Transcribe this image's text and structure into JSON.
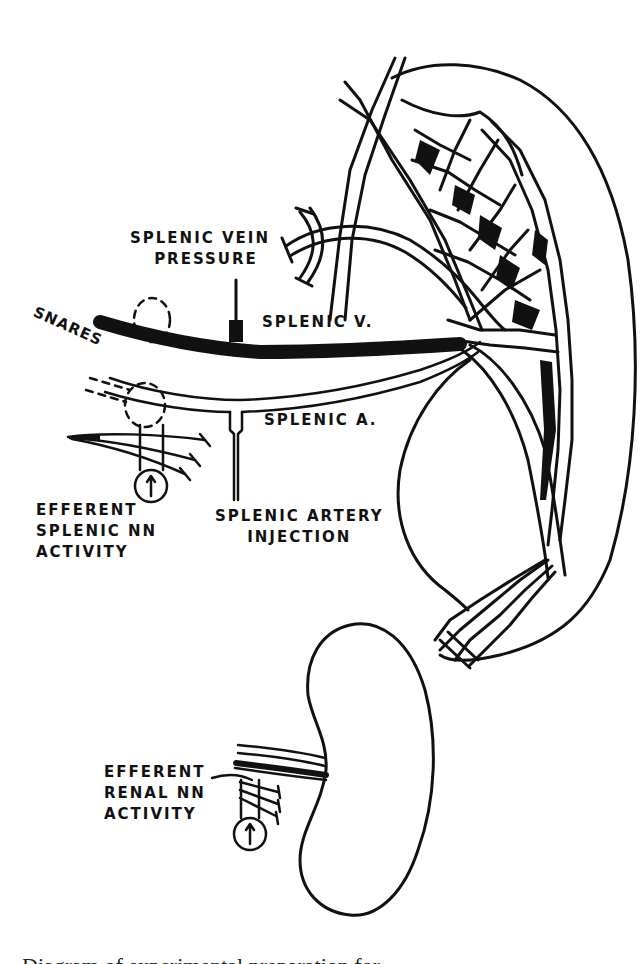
{
  "figure": {
    "labels": {
      "splenic_vein_pressure": [
        "SPLENIC VEIN",
        "PRESSURE"
      ],
      "splenic_vein": "SPLENIC V.",
      "splenic_artery": "SPLENIC A.",
      "snares": "SNARES",
      "splenic_artery_injection": [
        "SPLENIC ARTERY",
        "INJECTION"
      ],
      "efferent_splenic": [
        "EFFERENT",
        "SPLENIC NN",
        "ACTIVITY"
      ],
      "efferent_renal": [
        "EFFERENT",
        "RENAL NN",
        "ACTIVITY"
      ]
    },
    "structures": {
      "spleen": "spleen-outline",
      "kidney": "kidney-outline",
      "splenic_vein": "thick-vessel",
      "splenic_artery": "double-line-vessel",
      "recording_meter_glyph": "↑"
    },
    "caption": "Diagram of experimental preparation for..."
  },
  "colors": {
    "ink": "#111111",
    "paper": "#ffffff"
  }
}
